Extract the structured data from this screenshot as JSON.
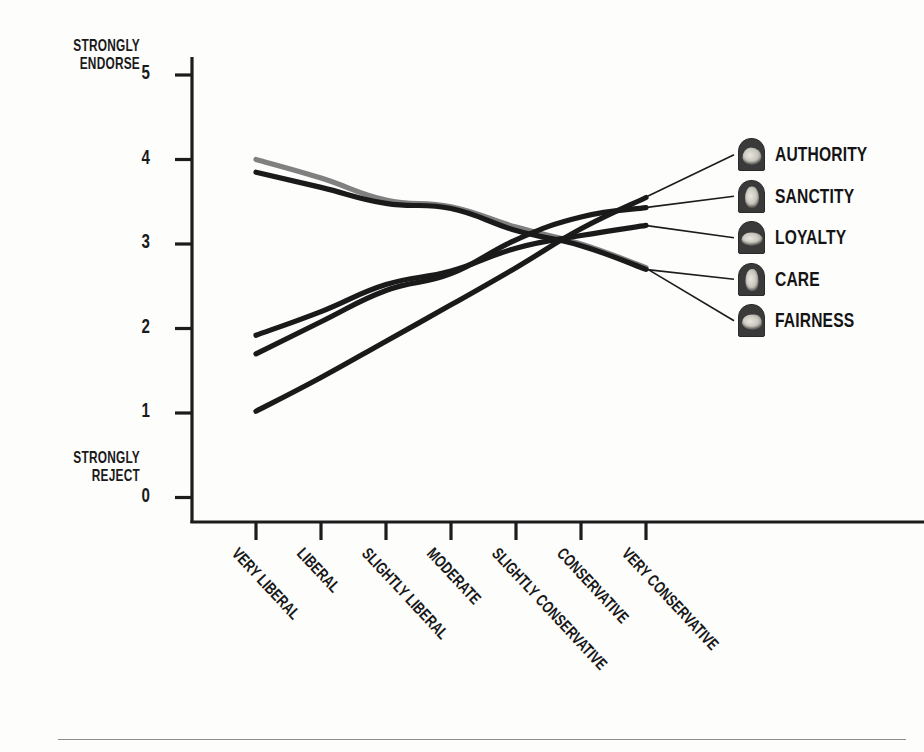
{
  "axis_annotations": {
    "top": "STRONGLY\nENDORSE",
    "top_line1": "STRONGLY",
    "top_line2": "ENDORSE",
    "bottom_line1": "STRONGLY",
    "bottom_line2": "REJECT"
  },
  "legend": {
    "items": [
      {
        "label": "AUTHORITY",
        "icon": "hand-authority-icon",
        "color": "#1a1a1a"
      },
      {
        "label": "SANCTITY",
        "icon": "hand-sanctity-icon",
        "color": "#1a1a1a"
      },
      {
        "label": "LOYALTY",
        "icon": "hand-loyalty-icon",
        "color": "#1a1a1a"
      },
      {
        "label": "CARE",
        "icon": "hand-care-icon",
        "color": "#1a1a1a"
      },
      {
        "label": "FAIRNESS",
        "icon": "hand-fairness-icon",
        "color": "#808080"
      }
    ]
  },
  "chart_data": {
    "type": "line",
    "title": "",
    "xlabel": "",
    "ylabel": "",
    "ylim": [
      0,
      5
    ],
    "yticks": [
      0,
      1,
      2,
      3,
      4,
      5
    ],
    "ytick_labels": [
      "0",
      "1",
      "2",
      "3",
      "4",
      "5"
    ],
    "y_axis_high_annotation": "STRONGLY ENDORSE",
    "y_axis_low_annotation": "STRONGLY REJECT",
    "grid": false,
    "legend_position": "right-outside",
    "categories": [
      "VERY LIBERAL",
      "LIBERAL",
      "SLIGHTLY LIBERAL",
      "MODERATE",
      "SLIGHTLY CONSERVATIVE",
      "CONSERVATIVE",
      "VERY CONSERVATIVE"
    ],
    "series": [
      {
        "name": "FAIRNESS",
        "color": "#808080",
        "values": [
          4.0,
          3.78,
          3.52,
          3.44,
          3.2,
          3.0,
          2.72
        ]
      },
      {
        "name": "CARE",
        "color": "#1a1a1a",
        "values": [
          3.85,
          3.67,
          3.48,
          3.42,
          3.16,
          2.98,
          2.7
        ]
      },
      {
        "name": "LOYALTY",
        "color": "#1a1a1a",
        "values": [
          1.92,
          2.2,
          2.52,
          2.68,
          2.95,
          3.1,
          3.22
        ]
      },
      {
        "name": "SANCTITY",
        "color": "#1a1a1a",
        "values": [
          1.7,
          2.08,
          2.45,
          2.65,
          3.05,
          3.32,
          3.43
        ]
      },
      {
        "name": "AUTHORITY",
        "color": "#1a1a1a",
        "values": [
          1.02,
          1.42,
          1.85,
          2.28,
          2.72,
          3.18,
          3.55
        ]
      }
    ],
    "annotations": [
      {
        "text": "leader line AUTHORITY",
        "from_series": "AUTHORITY",
        "to_legend": "AUTHORITY"
      },
      {
        "text": "leader line SANCTITY",
        "from_series": "SANCTITY",
        "to_legend": "SANCTITY"
      },
      {
        "text": "leader line LOYALTY",
        "from_series": "LOYALTY",
        "to_legend": "LOYALTY"
      },
      {
        "text": "leader line CARE",
        "from_series": "CARE",
        "to_legend": "CARE"
      },
      {
        "text": "leader line FAIRNESS",
        "from_series": "FAIRNESS",
        "to_legend": "FAIRNESS"
      }
    ]
  }
}
